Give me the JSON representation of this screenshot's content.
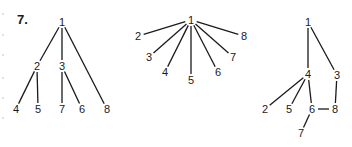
{
  "figure_number": "7.",
  "trees": [
    {
      "id": "tree-a",
      "nodes": [
        {
          "label": "1",
          "x": 62,
          "y": 22
        },
        {
          "label": "2",
          "x": 37,
          "y": 66
        },
        {
          "label": "3",
          "x": 62,
          "y": 66
        },
        {
          "label": "4",
          "x": 16,
          "y": 109
        },
        {
          "label": "5",
          "x": 38,
          "y": 109
        },
        {
          "label": "7",
          "x": 62,
          "y": 109
        },
        {
          "label": "6",
          "x": 82,
          "y": 109
        },
        {
          "label": "8",
          "x": 107,
          "y": 109
        }
      ],
      "edges": [
        [
          "1",
          "2"
        ],
        [
          "1",
          "3"
        ],
        [
          "1",
          "8"
        ],
        [
          "2",
          "4"
        ],
        [
          "2",
          "5"
        ],
        [
          "3",
          "7"
        ],
        [
          "3",
          "6"
        ]
      ]
    },
    {
      "id": "tree-b",
      "nodes": [
        {
          "label": "1",
          "x": 191,
          "y": 20
        },
        {
          "label": "2",
          "x": 138,
          "y": 36
        },
        {
          "label": "3",
          "x": 149,
          "y": 57
        },
        {
          "label": "4",
          "x": 165,
          "y": 72
        },
        {
          "label": "5",
          "x": 191,
          "y": 80
        },
        {
          "label": "6",
          "x": 218,
          "y": 72
        },
        {
          "label": "7",
          "x": 233,
          "y": 57
        },
        {
          "label": "8",
          "x": 244,
          "y": 36
        }
      ],
      "edges": [
        [
          "1",
          "2"
        ],
        [
          "1",
          "3"
        ],
        [
          "1",
          "4"
        ],
        [
          "1",
          "5"
        ],
        [
          "1",
          "6"
        ],
        [
          "1",
          "7"
        ],
        [
          "1",
          "8"
        ]
      ]
    },
    {
      "id": "tree-c",
      "nodes": [
        {
          "label": "1",
          "x": 308,
          "y": 22
        },
        {
          "label": "4",
          "x": 308,
          "y": 74
        },
        {
          "label": "3",
          "x": 337,
          "y": 75
        },
        {
          "label": "2",
          "x": 265,
          "y": 109
        },
        {
          "label": "5",
          "x": 289,
          "y": 109
        },
        {
          "label": "6",
          "x": 312,
          "y": 109
        },
        {
          "label": "8",
          "x": 335,
          "y": 109
        },
        {
          "label": "7",
          "x": 301,
          "y": 133
        }
      ],
      "edges": [
        [
          "1",
          "4"
        ],
        [
          "1",
          "3"
        ],
        [
          "4",
          "2"
        ],
        [
          "4",
          "5"
        ],
        [
          "4",
          "6"
        ],
        [
          "3",
          "8"
        ],
        [
          "6",
          "8"
        ],
        [
          "6",
          "7"
        ]
      ]
    }
  ]
}
